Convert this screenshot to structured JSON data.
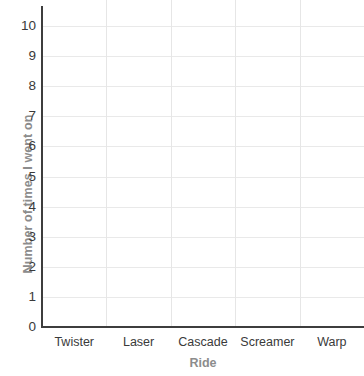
{
  "chart_data": {
    "type": "bar",
    "title": "",
    "xlabel": "Ride",
    "ylabel": "Number of times I went on",
    "categories": [
      "Twister",
      "Laser",
      "Cascade",
      "Screamer",
      "Warp"
    ],
    "values": [
      null,
      null,
      null,
      null,
      null
    ],
    "series": [
      {
        "name": "Number of times I went on",
        "values": [
          null,
          null,
          null,
          null,
          null
        ]
      }
    ],
    "ylim": [
      0,
      10
    ],
    "y_ticks": [
      0,
      1,
      2,
      3,
      4,
      5,
      6,
      7,
      8,
      9,
      10
    ],
    "y_tick_labels": [
      "0",
      "1",
      "2",
      "3",
      "4",
      "5",
      "6",
      "7",
      "8",
      "9",
      "10"
    ],
    "grid": true,
    "legend": false,
    "legend_position": "none",
    "note": "Empty grid template - no bars plotted",
    "colors": {
      "background": "#ffffff",
      "axis_line": "#3d3d3d",
      "gridline_horizontal": "#e9e9e9",
      "gridline_vertical": "#e6e6e6",
      "tick_label": "#3a3a3a",
      "axis_title": "#8c8c8c"
    }
  }
}
